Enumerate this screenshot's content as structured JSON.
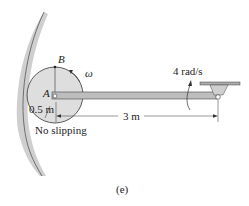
{
  "figure": {
    "labels": {
      "point_b": "B",
      "point_a": "A",
      "omega": "ω",
      "angular_velocity": "4 rad/s",
      "radius": "0.5 m",
      "length": "3 m",
      "condition": "No slipping",
      "caption": "(e)"
    },
    "colors": {
      "wall": "#c8c8c8",
      "disk": "#dedede",
      "rod": "#bdbdbd",
      "line": "#333333"
    }
  }
}
